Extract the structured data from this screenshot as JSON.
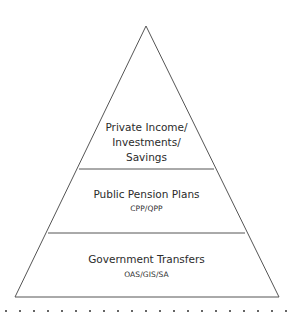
{
  "diagram": {
    "type": "pyramid",
    "line_color": "#555555",
    "tiers": [
      {
        "level": "top",
        "title_lines": [
          "Private Income/",
          "Investments/",
          "Savings"
        ],
        "subtitle": ""
      },
      {
        "level": "middle",
        "title_lines": [
          "Public Pension Plans"
        ],
        "subtitle": "CPP/QPP"
      },
      {
        "level": "bottom",
        "title_lines": [
          "Government Transfers"
        ],
        "subtitle": "OAS/GIS/SA"
      }
    ]
  }
}
